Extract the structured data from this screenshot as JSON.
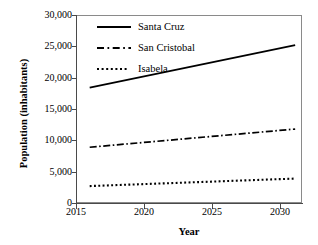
{
  "chart_data": {
    "type": "line",
    "title": "",
    "xlabel": "Year",
    "ylabel": "Population (inhabitants)",
    "xlim": [
      2015,
      2031.5
    ],
    "ylim": [
      0,
      30000
    ],
    "xticks": [
      2015,
      2020,
      2025,
      2030
    ],
    "xtick_labels": [
      "2015",
      "2020",
      "2025",
      "2030"
    ],
    "yticks": [
      0,
      5000,
      10000,
      15000,
      20000,
      25000,
      30000
    ],
    "ytick_labels": [
      "0",
      "5,000",
      "10,000",
      "15,000",
      "20,000",
      "25,000",
      "30,000"
    ],
    "grid": false,
    "legend_position": "upper-left-inside",
    "x": [
      2016,
      2031
    ],
    "series": [
      {
        "name": "Santa Cruz",
        "linestyle": "solid",
        "color": "#000000",
        "values": [
          18400,
          25200
        ]
      },
      {
        "name": "San Cristobal",
        "linestyle": "dash-dot",
        "color": "#000000",
        "values": [
          8900,
          11800
        ]
      },
      {
        "name": "Isabela",
        "linestyle": "dotted",
        "color": "#000000",
        "values": [
          2700,
          3900
        ]
      }
    ]
  },
  "axes": {
    "x_title": "Year",
    "y_title": "Population (inhabitants)",
    "x_tick_labels": [
      "2015",
      "2020",
      "2025",
      "2030"
    ],
    "y_tick_labels": [
      "30,000",
      "25,000",
      "20,000",
      "15,000",
      "10,000",
      "5,000",
      "0"
    ]
  },
  "legend": {
    "entries": [
      {
        "label": "Santa Cruz",
        "style": "solid"
      },
      {
        "label": "San Cristobal",
        "style": "dash-dot"
      },
      {
        "label": "Isabela",
        "style": "dotted"
      }
    ]
  },
  "colors": {
    "line": "#000000",
    "frame": "#8a8a8a",
    "spine": "#4a4a4a",
    "background": "#ffffff"
  }
}
